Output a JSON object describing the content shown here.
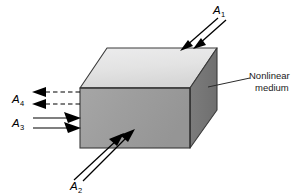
{
  "figure": {
    "background_color": "#ffffff",
    "width": 303,
    "height": 194
  },
  "medium": {
    "callout_line_1": "Nonlinear",
    "callout_line_2": "medium",
    "front_face_color": "#a0a0a0",
    "top_face_color": "#e4e4e4",
    "side_face_color": "#767676",
    "edge_color": "#3a3a3a"
  },
  "waves": [
    {
      "id": "A1",
      "base": "A",
      "subscript": "1",
      "style": "solid",
      "direction": "incoming",
      "face": "top",
      "description": "Two solid arrows entering the top face from the upper right"
    },
    {
      "id": "A2",
      "base": "A",
      "subscript": "2",
      "style": "solid",
      "direction": "incoming",
      "face": "front-bottom",
      "description": "Two solid arrows entering the front face from the lower left"
    },
    {
      "id": "A3",
      "base": "A",
      "subscript": "3",
      "style": "solid",
      "direction": "incoming",
      "face": "front-left",
      "description": "Two solid horizontal arrows entering the front face from the left"
    },
    {
      "id": "A4",
      "base": "A",
      "subscript": "4",
      "style": "dashed",
      "direction": "outgoing",
      "face": "front-left",
      "description": "Two dashed horizontal arrows leaving the front face toward the left"
    }
  ],
  "colors": {
    "stroke": "#000000",
    "text": "#000000",
    "callout_text": "#1a1a1a",
    "leader_line": "#2b2b2b"
  }
}
